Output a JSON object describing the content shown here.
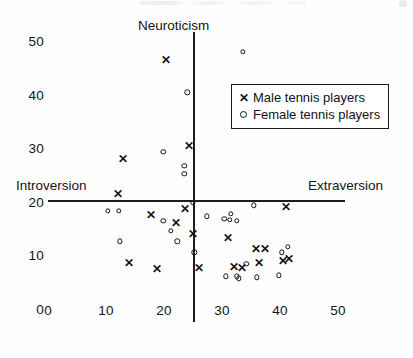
{
  "chart_data": {
    "type": "scatter",
    "title": "",
    "xlabel": "",
    "ylabel": "",
    "axis_annotations": {
      "top": "Neuroticism",
      "left": "Introversion",
      "right": "Extraversion"
    },
    "xlim": [
      0,
      55
    ],
    "ylim": [
      0,
      53
    ],
    "xticks": [
      0,
      10,
      20,
      30,
      40,
      50
    ],
    "xtick_labels": [
      "0",
      "10",
      "20",
      "30",
      "40",
      "50"
    ],
    "yticks": [
      0,
      10,
      20,
      30,
      40,
      50
    ],
    "ytick_labels": [
      "0",
      "10",
      "20",
      "30",
      "40",
      "50"
    ],
    "grid": false,
    "axis_origin": [
      25,
      20
    ],
    "legend_position": "upper right",
    "series": [
      {
        "name": "Male tennis players",
        "marker": "x",
        "color": "#111111",
        "points": [
          [
            20.3,
            46.5
          ],
          [
            12.9,
            27.9
          ],
          [
            24.3,
            30.5
          ],
          [
            12.0,
            21.5
          ],
          [
            23.6,
            18.6
          ],
          [
            17.8,
            17.5
          ],
          [
            22.0,
            16.0
          ],
          [
            25.0,
            14.0
          ],
          [
            31.0,
            13.3
          ],
          [
            35.9,
            11.2
          ],
          [
            37.4,
            11.2
          ],
          [
            41.0,
            19.0
          ],
          [
            36.4,
            8.6
          ],
          [
            40.5,
            9.0
          ],
          [
            41.5,
            9.3
          ],
          [
            14.0,
            8.5
          ],
          [
            18.8,
            7.4
          ],
          [
            26.0,
            7.6
          ],
          [
            32.0,
            7.8
          ],
          [
            33.5,
            7.6
          ]
        ]
      },
      {
        "name": "Female  tennis players",
        "marker": "o",
        "color": "#131313",
        "points": [
          [
            33.6,
            48.2
          ],
          [
            24.0,
            40.6
          ],
          [
            19.9,
            29.5
          ],
          [
            23.5,
            26.9
          ],
          [
            23.5,
            25.4
          ],
          [
            25.0,
            20.0
          ],
          [
            27.4,
            17.5
          ],
          [
            30.4,
            17.0
          ],
          [
            31.5,
            18.0
          ],
          [
            32.5,
            16.6
          ],
          [
            35.5,
            19.5
          ],
          [
            10.3,
            18.5
          ],
          [
            12.2,
            18.5
          ],
          [
            19.9,
            16.6
          ],
          [
            21.2,
            14.8
          ],
          [
            22.3,
            12.8
          ],
          [
            12.4,
            12.8
          ],
          [
            31.3,
            16.8
          ],
          [
            40.3,
            10.8
          ],
          [
            41.3,
            11.8
          ],
          [
            34.2,
            8.6
          ],
          [
            32.9,
            5.9
          ],
          [
            25.2,
            10.8
          ],
          [
            30.7,
            6.3
          ],
          [
            32.6,
            6.3
          ],
          [
            36.0,
            6.1
          ],
          [
            39.8,
            6.5
          ]
        ]
      }
    ]
  }
}
